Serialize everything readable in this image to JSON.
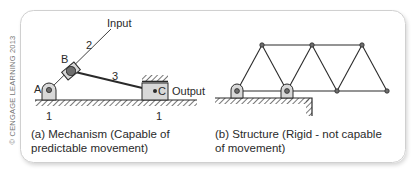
{
  "figure": {
    "copyright": "© CENGAGE LEARNING 2013",
    "panel_a": {
      "caption_line1": "(a) Mechanism (Capable of",
      "caption_line2": "predictable movement)",
      "labels": {
        "input": "Input",
        "link_2": "2",
        "link_3": "3",
        "joint_a": "A",
        "joint_b": "B",
        "joint_c": "C",
        "output": "Output",
        "ground_left": "1",
        "ground_right": "1"
      }
    },
    "panel_b": {
      "caption_line1": "(b) Structure (Rigid - not capable",
      "caption_line2": "of movement)"
    },
    "colors": {
      "line": "#2a2a2a",
      "joint_fill": "#6e6e6e",
      "support_fill": "#d8d8d8",
      "frame": "#cfcfcf"
    }
  }
}
